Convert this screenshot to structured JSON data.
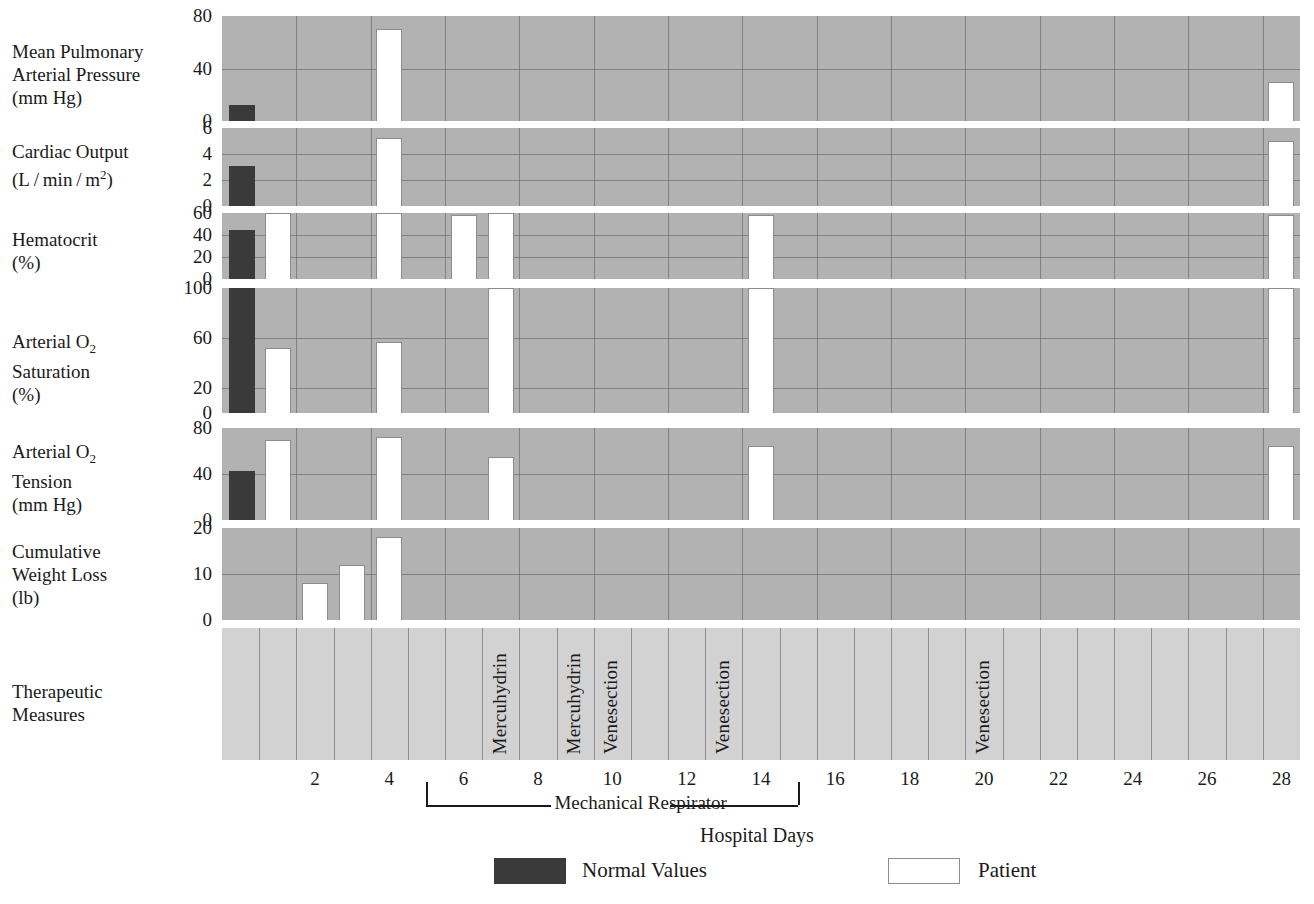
{
  "chart_data": {
    "type": "bar",
    "title": "",
    "xlabel": "Hospital Days",
    "x_ticks": [
      2,
      4,
      6,
      8,
      10,
      12,
      14,
      16,
      18,
      20,
      22,
      24,
      26,
      28
    ],
    "x_range": [
      0,
      29
    ],
    "grid": true,
    "legend": {
      "position": "bottom",
      "entries": [
        {
          "name": "Normal Values",
          "color": "#3a3a3a"
        },
        {
          "name": "Patient",
          "color": "#ffffff"
        }
      ]
    },
    "annotations": [
      {
        "text": "Mechanical Respirator",
        "x_start": 5,
        "x_end": 15,
        "type": "bracket"
      }
    ],
    "panels": [
      {
        "label_lines": [
          "Mean Pulmonary",
          "Arterial Pressure",
          "(mm Hg)"
        ],
        "ylabel": "Mean Pulmonary Arterial Pressure (mm Hg)",
        "units": "mm Hg",
        "ylim": [
          0,
          80
        ],
        "yticks": [
          0,
          40,
          80
        ],
        "normal_value": 12,
        "series": [
          {
            "name": "Normal Values",
            "day": 0,
            "value": 12,
            "kind": "normal"
          },
          {
            "name": "Patient",
            "day": 4,
            "value": 70,
            "kind": "patient"
          },
          {
            "name": "Patient",
            "day": 28,
            "value": 30,
            "kind": "patient"
          }
        ]
      },
      {
        "label_lines": [
          "Cardiac Output",
          "(L / min / m2)"
        ],
        "ylabel": "Cardiac Output (L/min/m2)",
        "units": "L/min/m2",
        "ylim": [
          0,
          6
        ],
        "yticks": [
          0,
          2,
          4,
          6
        ],
        "normal_value": 3.1,
        "series": [
          {
            "name": "Normal Values",
            "day": 0,
            "value": 3.1,
            "kind": "normal"
          },
          {
            "name": "Patient",
            "day": 4,
            "value": 5.2,
            "kind": "patient"
          },
          {
            "name": "Patient",
            "day": 28,
            "value": 5.0,
            "kind": "patient"
          }
        ]
      },
      {
        "label_lines": [
          "Hematocrit",
          "(%)"
        ],
        "ylabel": "Hematocrit (%)",
        "units": "%",
        "ylim": [
          0,
          60
        ],
        "yticks": [
          0,
          20,
          40,
          60
        ],
        "normal_value": 45,
        "series": [
          {
            "name": "Normal Values",
            "day": 0,
            "value": 45,
            "kind": "normal"
          },
          {
            "name": "Patient",
            "day": 1,
            "value": 60,
            "kind": "patient"
          },
          {
            "name": "Patient",
            "day": 4,
            "value": 60,
            "kind": "patient"
          },
          {
            "name": "Patient",
            "day": 6,
            "value": 58,
            "kind": "patient"
          },
          {
            "name": "Patient",
            "day": 7,
            "value": 60,
            "kind": "patient"
          },
          {
            "name": "Patient",
            "day": 14,
            "value": 58,
            "kind": "patient"
          },
          {
            "name": "Patient",
            "day": 28,
            "value": 58,
            "kind": "patient"
          }
        ]
      },
      {
        "label_lines": [
          "Arterial O2",
          "Saturation",
          "(%)"
        ],
        "ylabel": "Arterial O2 Saturation (%)",
        "units": "%",
        "ylim": [
          0,
          100
        ],
        "yticks": [
          0,
          20,
          60,
          100
        ],
        "normal_value": 100,
        "series": [
          {
            "name": "Normal Values",
            "day": 0,
            "value": 100,
            "kind": "normal"
          },
          {
            "name": "Patient",
            "day": 1,
            "value": 52,
            "kind": "patient"
          },
          {
            "name": "Patient",
            "day": 4,
            "value": 57,
            "kind": "patient"
          },
          {
            "name": "Patient",
            "day": 7,
            "value": 100,
            "kind": "patient"
          },
          {
            "name": "Patient",
            "day": 14,
            "value": 100,
            "kind": "patient"
          },
          {
            "name": "Patient",
            "day": 28,
            "value": 100,
            "kind": "patient"
          }
        ]
      },
      {
        "label_lines": [
          "Arterial CO2",
          "Tension",
          "(mm Hg)"
        ],
        "ylabel": "Arterial CO2 Tension (mm Hg)",
        "units": "mm Hg",
        "ylim": [
          0,
          80
        ],
        "yticks": [
          0,
          40,
          80
        ],
        "normal_value": 43,
        "series": [
          {
            "name": "Normal Values",
            "day": 0,
            "value": 43,
            "kind": "normal"
          },
          {
            "name": "Patient",
            "day": 1,
            "value": 70,
            "kind": "patient"
          },
          {
            "name": "Patient",
            "day": 4,
            "value": 72,
            "kind": "patient"
          },
          {
            "name": "Patient",
            "day": 7,
            "value": 55,
            "kind": "patient"
          },
          {
            "name": "Patient",
            "day": 14,
            "value": 64,
            "kind": "patient"
          },
          {
            "name": "Patient",
            "day": 28,
            "value": 64,
            "kind": "patient"
          }
        ]
      },
      {
        "label_lines": [
          "Cumulative",
          "Weight Loss",
          "(lb)"
        ],
        "ylabel": "Cumulative Weight Loss (lb)",
        "units": "lb",
        "ylim": [
          0,
          20
        ],
        "yticks": [
          0,
          10,
          20
        ],
        "normal_value": null,
        "series": [
          {
            "name": "Patient",
            "day": 2,
            "value": 8,
            "kind": "patient"
          },
          {
            "name": "Patient",
            "day": 3,
            "value": 12,
            "kind": "patient"
          },
          {
            "name": "Patient",
            "day": 4,
            "value": 18,
            "kind": "patient"
          }
        ]
      }
    ],
    "therapy_panel": {
      "label_lines": [
        "Therapeutic",
        "Measures"
      ],
      "events": [
        {
          "day": 1,
          "label": "Mercuhydrin"
        },
        {
          "day": 3,
          "label": "Mercuhydrin"
        },
        {
          "day": 4,
          "label": "Venesection"
        },
        {
          "day": 7,
          "label": "Venesection"
        },
        {
          "day": 14,
          "label": "Venesection"
        }
      ]
    }
  },
  "colors": {
    "normal": "#3a3a3a",
    "patient": "#ffffff",
    "plot_background": "#b2b2b2",
    "therapy_background": "#d2d2d2",
    "gridline": "#5a5a5a",
    "text": "#1a1a1a"
  }
}
